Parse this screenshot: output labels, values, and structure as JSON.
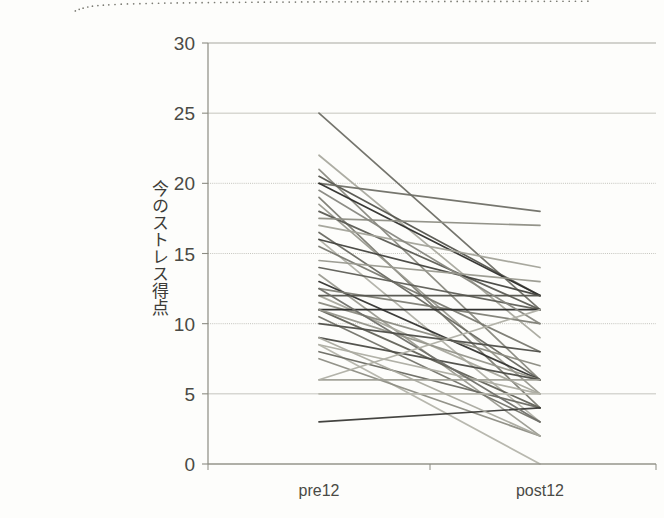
{
  "page": {
    "width": 664,
    "height": 518,
    "background": "#fdfdfb",
    "scan_artifact": "dotted-scan-edge-top-left"
  },
  "chart_data": {
    "type": "line",
    "title": "",
    "subtitle": "",
    "xlabel": "",
    "ylabel": "今のストレス得点",
    "categories": [
      "pre12",
      "post12"
    ],
    "ylim": [
      0,
      30
    ],
    "yticks": [
      0,
      5,
      10,
      15,
      20,
      25,
      30
    ],
    "ytick_labels": [
      "0",
      "5",
      "10",
      "15",
      "20",
      "25",
      "30"
    ],
    "grid": true,
    "grid_axis": "y",
    "legend": "none",
    "series": [
      {
        "name": "p01",
        "values": [
          25,
          11
        ],
        "color": "#6e6e66"
      },
      {
        "name": "p02",
        "values": [
          22,
          9
        ],
        "color": "#a9a99f"
      },
      {
        "name": "p03",
        "values": [
          21,
          6
        ],
        "color": "#8a8a80"
      },
      {
        "name": "p04",
        "values": [
          20.5,
          12
        ],
        "color": "#55554e"
      },
      {
        "name": "p05",
        "values": [
          20,
          18
        ],
        "color": "#6f6f67"
      },
      {
        "name": "p06",
        "values": [
          20,
          12
        ],
        "color": "#2f2f2c"
      },
      {
        "name": "p07",
        "values": [
          19,
          4
        ],
        "color": "#7d7d74"
      },
      {
        "name": "p08",
        "values": [
          18.5,
          5
        ],
        "color": "#9b9b91"
      },
      {
        "name": "p09",
        "values": [
          18,
          11
        ],
        "color": "#5b5b54"
      },
      {
        "name": "p10",
        "values": [
          17.5,
          17
        ],
        "color": "#8f8f85"
      },
      {
        "name": "p11",
        "values": [
          17,
          14
        ],
        "color": "#a4a49a"
      },
      {
        "name": "p12",
        "values": [
          16.5,
          6
        ],
        "color": "#6a6a62"
      },
      {
        "name": "p13",
        "values": [
          16,
          3
        ],
        "color": "#b2b2a8"
      },
      {
        "name": "p14",
        "values": [
          16,
          12
        ],
        "color": "#44443f"
      },
      {
        "name": "p15",
        "values": [
          15.5,
          8
        ],
        "color": "#7a7a71"
      },
      {
        "name": "p16",
        "values": [
          14,
          11
        ],
        "color": "#5e5e57"
      },
      {
        "name": "p17",
        "values": [
          13.5,
          2
        ],
        "color": "#9c9c92"
      },
      {
        "name": "p18",
        "values": [
          13,
          6
        ],
        "color": "#343431"
      },
      {
        "name": "p19",
        "values": [
          12.5,
          10
        ],
        "color": "#7f7f76"
      },
      {
        "name": "p20",
        "values": [
          12,
          5
        ],
        "color": "#a8a89e"
      },
      {
        "name": "p21",
        "values": [
          12,
          12
        ],
        "color": "#54544d"
      },
      {
        "name": "p22",
        "values": [
          11.5,
          7
        ],
        "color": "#8c8c82"
      },
      {
        "name": "p23",
        "values": [
          11,
          4
        ],
        "color": "#636359"
      },
      {
        "name": "p24",
        "values": [
          11,
          11
        ],
        "color": "#292927"
      },
      {
        "name": "p25",
        "values": [
          11,
          6
        ],
        "color": "#96968c"
      },
      {
        "name": "p26",
        "values": [
          10.5,
          3
        ],
        "color": "#75756c"
      },
      {
        "name": "p27",
        "values": [
          9,
          6
        ],
        "color": "#4c4c46"
      },
      {
        "name": "p28",
        "values": [
          8.5,
          5
        ],
        "color": "#adada3"
      },
      {
        "name": "p29",
        "values": [
          8.5,
          0
        ],
        "color": "#b5b5ab"
      },
      {
        "name": "p30",
        "values": [
          8,
          4
        ],
        "color": "#6b6b63"
      },
      {
        "name": "p31",
        "values": [
          7.5,
          2
        ],
        "color": "#8e8e84"
      },
      {
        "name": "p32",
        "values": [
          6,
          6
        ],
        "color": "#a0a096"
      },
      {
        "name": "p33",
        "values": [
          5,
          5
        ],
        "color": "#b6b6ac"
      },
      {
        "name": "p34",
        "values": [
          3,
          4
        ],
        "color": "#3a3a36"
      },
      {
        "name": "p35",
        "values": [
          19.5,
          10
        ],
        "color": "#888880"
      },
      {
        "name": "p36",
        "values": [
          14.5,
          13
        ],
        "color": "#99998f"
      },
      {
        "name": "p37",
        "values": [
          12.5,
          3
        ],
        "color": "#70706a"
      },
      {
        "name": "p38",
        "values": [
          10,
          8
        ],
        "color": "#4f4f49"
      },
      {
        "name": "p39",
        "values": [
          9,
          2
        ],
        "color": "#aaaaa0"
      },
      {
        "name": "p40",
        "values": [
          6,
          11
        ],
        "color": "#b0b0a6"
      }
    ]
  },
  "axes": {
    "y_tick_labels": [
      "30",
      "25",
      "20",
      "15",
      "10",
      "5",
      "0"
    ],
    "x_tick_labels": [
      "pre12",
      "post12"
    ],
    "y_title": "今のストレス得点",
    "axis_color": "#8b8b82",
    "grid_color": "#9a9a90",
    "text_color": "#4a4a45"
  }
}
